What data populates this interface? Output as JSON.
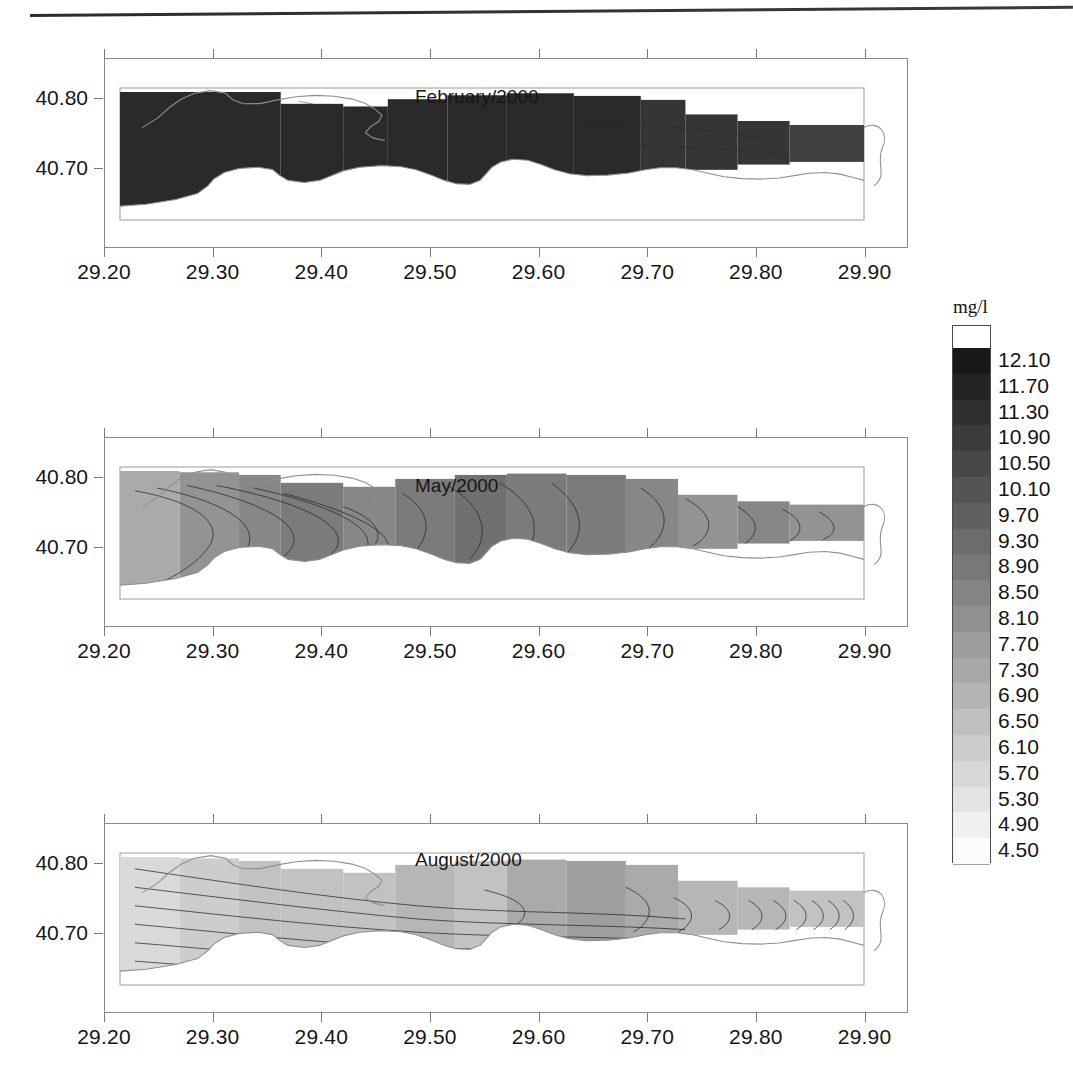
{
  "figure": {
    "kind": "contour-map-series",
    "variable": "Dissolved oxygen",
    "unit_label": "mg/l",
    "top_rule": "page-edge-rule"
  },
  "axes": {
    "x_ticks": [
      "29.20",
      "29.30",
      "29.40",
      "29.50",
      "29.60",
      "29.70",
      "29.80",
      "29.90"
    ],
    "y_ticks": [
      "40.80",
      "40.70"
    ],
    "x_range": [
      29.2,
      29.94
    ],
    "y_range": [
      40.655,
      40.835
    ]
  },
  "panels": [
    {
      "title": "February/2000",
      "season": "winter",
      "tone": "dark"
    },
    {
      "title": "May/2000",
      "season": "spring",
      "tone": "medium"
    },
    {
      "title": "August/2000",
      "season": "summer",
      "tone": "light"
    }
  ],
  "colorbar": {
    "unit": "mg/l",
    "labels": [
      "12.10",
      "11.70",
      "11.30",
      "10.90",
      "10.50",
      "10.10",
      "9.70",
      "9.30",
      "8.90",
      "8.50",
      "8.10",
      "7.70",
      "7.30",
      "6.90",
      "6.50",
      "6.10",
      "5.70",
      "5.30",
      "4.90",
      "4.50"
    ],
    "min": 4.5,
    "max": 12.1,
    "step": 0.4,
    "low_color": "#ffffff",
    "high_color": "#1a1a1a"
  },
  "chart_data": {
    "type": "heatmap",
    "xlabel": "Longitude (°E)",
    "ylabel": "Latitude (°N)",
    "x": [
      29.2,
      29.3,
      29.4,
      29.5,
      29.6,
      29.7,
      29.8,
      29.9
    ],
    "y": [
      40.7,
      40.8
    ],
    "xlim": [
      29.2,
      29.94
    ],
    "ylim": [
      40.655,
      40.835
    ],
    "grid": false,
    "legend": "colorbar-right",
    "colorbar": {
      "label": "mg/l",
      "ticks": [
        12.1,
        11.7,
        11.3,
        10.9,
        10.5,
        10.1,
        9.7,
        9.3,
        8.9,
        8.5,
        8.1,
        7.7,
        7.3,
        6.9,
        6.5,
        6.1,
        5.7,
        5.3,
        4.9,
        4.5
      ],
      "vmin": 4.5,
      "vmax": 12.1,
      "step": 0.4
    },
    "panels": [
      {
        "name": "February/2000",
        "annotation": "February/2000",
        "value_range": [
          10.5,
          12.1
        ],
        "typical_value": 11.7,
        "description": "Near-uniform very high dissolved oxygen across the whole bay; almost the entire mapped area falls in the two darkest classes."
      },
      {
        "name": "May/2000",
        "annotation": "May/2000",
        "value_range": [
          6.9,
          9.7
        ],
        "typical_value": 8.5,
        "description": "Intermediate values with strong horizontal gradients; closed contour cells near 29.34 and 29.70, lighter values at the western head and along the southern shore."
      },
      {
        "name": "August/2000",
        "annotation": "August/2000",
        "value_range": [
          4.9,
          8.5
        ],
        "typical_value": 6.5,
        "description": "Lowest dissolved oxygen of the three surveys; lightest tones in the western basin, a darker core near 29.60-29.65 and tightly packed contours at the eastern exit."
      }
    ]
  }
}
